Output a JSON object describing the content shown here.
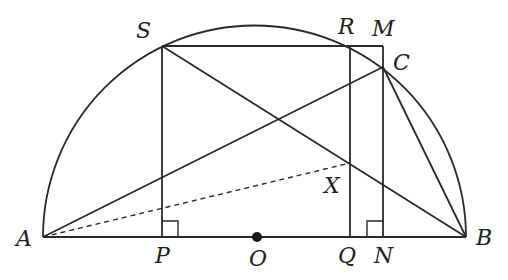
{
  "diagram": {
    "type": "geometry",
    "points": {
      "A": {
        "label": "A",
        "x": 43,
        "y": 237
      },
      "B": {
        "label": "B",
        "x": 466,
        "y": 237
      },
      "O": {
        "label": "O",
        "x": 257,
        "y": 237
      },
      "S": {
        "label": "S",
        "x": 162,
        "y": 46
      },
      "R": {
        "label": "R",
        "x": 350,
        "y": 46
      },
      "M": {
        "label": "M",
        "x": 383,
        "y": 46
      },
      "C": {
        "label": "C",
        "x": 383,
        "y": 67
      },
      "P": {
        "label": "P",
        "x": 162,
        "y": 237
      },
      "Q": {
        "label": "Q",
        "x": 350,
        "y": 237
      },
      "N": {
        "label": "N",
        "x": 383,
        "y": 237
      },
      "X": {
        "label": "X",
        "x": 350,
        "y": 163
      }
    },
    "labels": {
      "A": "A",
      "B": "B",
      "O": "O",
      "S": "S",
      "R": "R",
      "M": "M",
      "C": "C",
      "P": "P",
      "Q": "Q",
      "N": "N",
      "X": "X"
    },
    "segments": [
      "AB",
      "SM",
      "SP",
      "RQ",
      "MN",
      "SB",
      "AC",
      "CB",
      "AX (dashed)"
    ],
    "right_angles": [
      "P",
      "N"
    ],
    "stroke_color": "#2a2a2a"
  }
}
